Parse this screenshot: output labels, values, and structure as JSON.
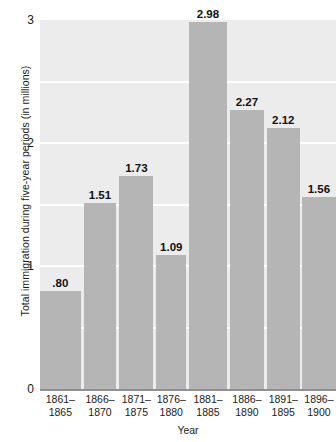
{
  "chart_data": {
    "type": "bar",
    "title": "",
    "xlabel": "Year",
    "ylabel": "Total immigration during five-year periods (in millions)",
    "categories": [
      "1861–\n1865",
      "1866–\n1870",
      "1871–\n1875",
      "1876–\n1880",
      "1881–\n1885",
      "1886–\n1890",
      "1891–\n1895",
      "1896–\n1900"
    ],
    "category_lines": [
      [
        "1861–",
        "1865"
      ],
      [
        "1866–",
        "1870"
      ],
      [
        "1871–",
        "1875"
      ],
      [
        "1876–",
        "1880"
      ],
      [
        "1881–",
        "1885"
      ],
      [
        "1886–",
        "1890"
      ],
      [
        "1891–",
        "1895"
      ],
      [
        "1896–",
        "1900"
      ]
    ],
    "values": [
      0.8,
      1.51,
      1.73,
      1.09,
      2.98,
      2.27,
      2.12,
      1.56
    ],
    "value_labels": [
      ".80",
      "1.51",
      "1.73",
      "1.09",
      "2.98",
      "2.27",
      "2.12",
      "1.56"
    ],
    "ylim": [
      0,
      3
    ],
    "ytick_labels": [
      "0",
      "1",
      "2",
      "3"
    ],
    "ytick_values": [
      0,
      1,
      2,
      3
    ],
    "gridlines_at": [
      0.5,
      1.0,
      1.5,
      2.0,
      2.5
    ],
    "grid": true,
    "legend": "none",
    "colors": {
      "bar": "#b5b5b5",
      "plot_background": "#ececec",
      "gridline": "#ffffff",
      "axis": "#8f8f8f",
      "text": "#1a1a1a"
    }
  }
}
